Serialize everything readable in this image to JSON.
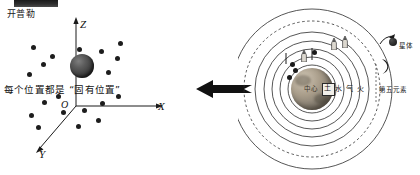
{
  "meta": {
    "width": 420,
    "height": 175,
    "background": "#ffffff",
    "ink": "#1a1a1a"
  },
  "left_panel": {
    "caption": "开普勒",
    "note": "每个位置都是",
    "note_quoted": "“固有位置”",
    "axes": {
      "z_label": "Z",
      "x_label": "X",
      "y_label": "Y",
      "origin_label": "O"
    },
    "sphere": {
      "name": "large-sphere",
      "color": "#3d3d3d"
    },
    "dots": [
      {
        "x": 31,
        "y": 45
      },
      {
        "x": 50,
        "y": 54
      },
      {
        "x": 41,
        "y": 62
      },
      {
        "x": 27,
        "y": 72
      },
      {
        "x": 77,
        "y": 47
      },
      {
        "x": 99,
        "y": 49
      },
      {
        "x": 115,
        "y": 56
      },
      {
        "x": 106,
        "y": 70
      },
      {
        "x": 118,
        "y": 41
      },
      {
        "x": 42,
        "y": 100
      },
      {
        "x": 56,
        "y": 94
      },
      {
        "x": 61,
        "y": 110
      },
      {
        "x": 82,
        "y": 108
      },
      {
        "x": 100,
        "y": 101
      },
      {
        "x": 96,
        "y": 118
      },
      {
        "x": 76,
        "y": 124
      },
      {
        "x": 36,
        "y": 125
      },
      {
        "x": 29,
        "y": 113
      },
      {
        "x": 116,
        "y": 94
      }
    ]
  },
  "arrow": {
    "name": "leftward-arrow",
    "direction": "left",
    "color": "#111111"
  },
  "right_panel": {
    "title_elements": {
      "earth_center": "中心",
      "earth": "土",
      "water": "水",
      "air": "气",
      "fire": "火"
    },
    "star_label": "星体",
    "quintessence_label": "第五元素",
    "orbits": [
      {
        "r": 24,
        "style": "solid"
      },
      {
        "r": 32,
        "style": "solid"
      },
      {
        "r": 40,
        "style": "solid"
      },
      {
        "r": 48,
        "style": "solid"
      },
      {
        "r": 57,
        "style": "solid"
      },
      {
        "r": 68,
        "style": "dashed"
      },
      {
        "r": 80,
        "style": "solid"
      }
    ],
    "planet_dots": [
      {
        "x": 49,
        "y": 75
      },
      {
        "x": 55,
        "y": 68
      },
      {
        "x": 52,
        "y": 62
      },
      {
        "x": 74,
        "y": 50
      }
    ]
  }
}
